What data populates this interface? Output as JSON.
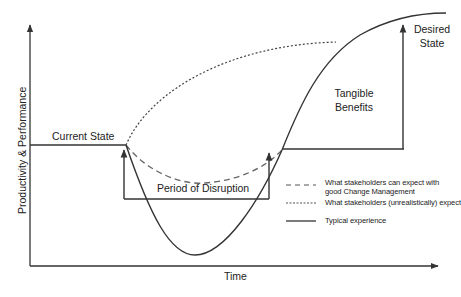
{
  "diagram": {
    "type": "change-curve",
    "colors": {
      "line": "#333333",
      "dashed": "#666666",
      "background": "#ffffff"
    },
    "axes": {
      "y_label": "Productivity & Performance",
      "x_label": "Time"
    },
    "annotations": {
      "current_state": "Current State",
      "period_of_disruption": "Period of Disruption",
      "tangible_benefits": "Tangible Benefits",
      "desired_state": "Desired State"
    },
    "legend": [
      {
        "style": "dashed",
        "label": "What stakeholders can expect with good Change Management"
      },
      {
        "style": "dotted",
        "label": "What stakeholders (unrealistically) expect"
      },
      {
        "style": "solid",
        "label": "Typical experience"
      }
    ],
    "curves": [
      {
        "name": "Typical experience",
        "style": "solid",
        "description": "Drops sharply below current state, reaches a deep minimum, then rises steeply past current state to the desired state plateau"
      },
      {
        "name": "What stakeholders can expect with good Change Management",
        "style": "dashed",
        "description": "Shallow dip below current state, recovers and joins typical curve"
      },
      {
        "name": "What stakeholders (unrealistically) expect",
        "style": "dotted",
        "description": "Immediate rise from current state toward desired state with no dip"
      }
    ]
  }
}
